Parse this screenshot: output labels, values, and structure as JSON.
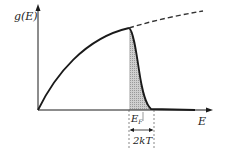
{
  "diagram": {
    "y_axis_label": "g(E)",
    "x_axis_label": "E",
    "fermi_label_main": "E",
    "fermi_label_sub": "F",
    "width_label": "2kT",
    "colors": {
      "line": "#1a1a1a",
      "shade": "#b8b8b8",
      "dashed": "#333333"
    }
  }
}
